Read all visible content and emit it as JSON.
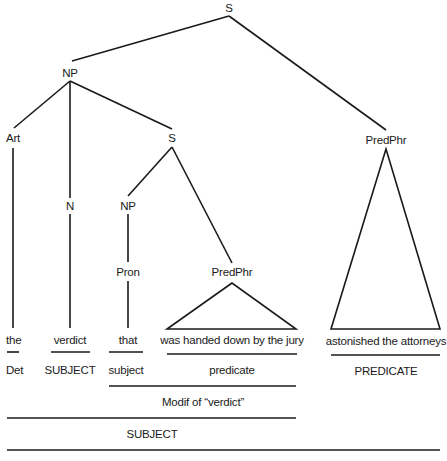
{
  "diagram": {
    "title": "",
    "type": "syntax-tree",
    "nodes": [
      {
        "id": "s_root",
        "label": "S",
        "x": 229,
        "y": 8
      },
      {
        "id": "np",
        "label": "NP",
        "x": 70,
        "y": 73
      },
      {
        "id": "art",
        "label": "Art",
        "x": 13,
        "y": 138
      },
      {
        "id": "s_inner",
        "label": "S",
        "x": 172,
        "y": 138
      },
      {
        "id": "predphr_main",
        "label": "PredPhr",
        "x": 386,
        "y": 140
      },
      {
        "id": "n",
        "label": "N",
        "x": 70,
        "y": 206
      },
      {
        "id": "np_inner",
        "label": "NP",
        "x": 128,
        "y": 206
      },
      {
        "id": "pron",
        "label": "Pron",
        "x": 128,
        "y": 272
      },
      {
        "id": "predphr_inner",
        "label": "PredPhr",
        "x": 232,
        "y": 272
      }
    ],
    "edges": [
      {
        "from": "s_root",
        "to": "np",
        "x1": 229,
        "y1": 16,
        "x2": 72,
        "y2": 61
      },
      {
        "from": "s_root",
        "to": "predphr_main",
        "x1": 229,
        "y1": 16,
        "x2": 386,
        "y2": 130
      },
      {
        "from": "np",
        "to": "art",
        "x1": 70,
        "y1": 81,
        "x2": 14,
        "y2": 128
      },
      {
        "from": "np",
        "to": "n",
        "x1": 70,
        "y1": 81,
        "x2": 70,
        "y2": 198
      },
      {
        "from": "np",
        "to": "s_inner",
        "x1": 70,
        "y1": 81,
        "x2": 172,
        "y2": 129
      },
      {
        "from": "s_inner",
        "to": "np_inner",
        "x1": 172,
        "y1": 147,
        "x2": 128,
        "y2": 196
      },
      {
        "from": "s_inner",
        "to": "predphr_inner",
        "x1": 172,
        "y1": 147,
        "x2": 232,
        "y2": 263
      },
      {
        "from": "np_inner",
        "to": "pron",
        "x1": 128,
        "y1": 214,
        "x2": 128,
        "y2": 262
      },
      {
        "from": "art",
        "to": "leaf_the",
        "x1": 13,
        "y1": 148,
        "x2": 13,
        "y2": 328
      },
      {
        "from": "n",
        "to": "leaf_verdict",
        "x1": 70,
        "y1": 214,
        "x2": 70,
        "y2": 328
      },
      {
        "from": "pron",
        "to": "leaf_that",
        "x1": 128,
        "y1": 281,
        "x2": 128,
        "y2": 328
      }
    ],
    "triangles": [
      {
        "id": "tri_inner",
        "apex": [
          232,
          283
        ],
        "left": [
          167,
          329
        ],
        "right": [
          296,
          329
        ]
      },
      {
        "id": "tri_main",
        "apex": [
          386,
          149
        ],
        "left": [
          331,
          329
        ],
        "right": [
          440,
          329
        ]
      }
    ],
    "leaves": [
      {
        "id": "leaf_the",
        "text": "the",
        "x": 13,
        "y": 340
      },
      {
        "id": "leaf_verdict",
        "text": "verdict",
        "x": 70,
        "y": 340
      },
      {
        "id": "leaf_that",
        "text": "that",
        "x": 128,
        "y": 340
      },
      {
        "id": "leaf_phrase_inner",
        "text": "was handed down by the jury",
        "x": 232,
        "y": 340
      },
      {
        "id": "leaf_phrase_main",
        "text": "astonished the attorneys",
        "x": 386,
        "y": 341
      }
    ],
    "function_rules": [
      {
        "x1": 7,
        "x2": 19,
        "y": 352
      },
      {
        "x1": 51,
        "x2": 90,
        "y": 352
      },
      {
        "x1": 109,
        "x2": 143,
        "y": 352
      },
      {
        "x1": 167,
        "x2": 297,
        "y": 354
      },
      {
        "x1": 331,
        "x2": 440,
        "y": 355
      },
      {
        "x1": 109,
        "x2": 296,
        "y": 386
      },
      {
        "x1": 7,
        "x2": 296,
        "y": 418
      },
      {
        "x1": 7,
        "x2": 440,
        "y": 450
      }
    ],
    "function_labels": [
      {
        "text": "Det",
        "x": 13,
        "y": 370
      },
      {
        "text": "SUBJECT",
        "x": 70,
        "y": 370
      },
      {
        "text": "subject",
        "x": 126,
        "y": 370
      },
      {
        "text": "predicate",
        "x": 232,
        "y": 370
      },
      {
        "text": "PREDICATE",
        "x": 386,
        "y": 371
      },
      {
        "text": "Modif of “verdict”",
        "x": 203,
        "y": 402
      },
      {
        "text": "SUBJECT",
        "x": 152,
        "y": 434
      }
    ]
  }
}
